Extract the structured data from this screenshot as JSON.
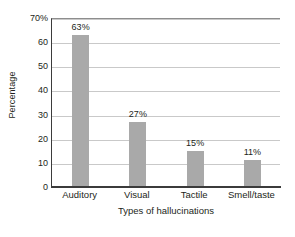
{
  "chart_data": {
    "type": "bar",
    "title": "",
    "categories": [
      "Auditory",
      "Visual",
      "Tactile",
      "Smell/taste"
    ],
    "values": [
      63,
      27,
      15,
      11
    ],
    "data_labels": [
      "63%",
      "27%",
      "15%",
      "11%"
    ],
    "xlabel": "Types of hallucinations",
    "ylabel": "Percentage",
    "ylim": [
      0,
      70
    ],
    "ytick_values": [
      0,
      10,
      20,
      30,
      40,
      50,
      60,
      70
    ],
    "ytick_labels": [
      "0",
      "10",
      "20",
      "30",
      "40",
      "50",
      "60",
      "70%"
    ],
    "grid": true,
    "legend": "none",
    "bar_color": "#a9a9a9",
    "axis_color": "#3b3b3b",
    "gridline_color": "#c9c9c9",
    "background_color": "#ffffff",
    "text_color": "#231f20"
  }
}
